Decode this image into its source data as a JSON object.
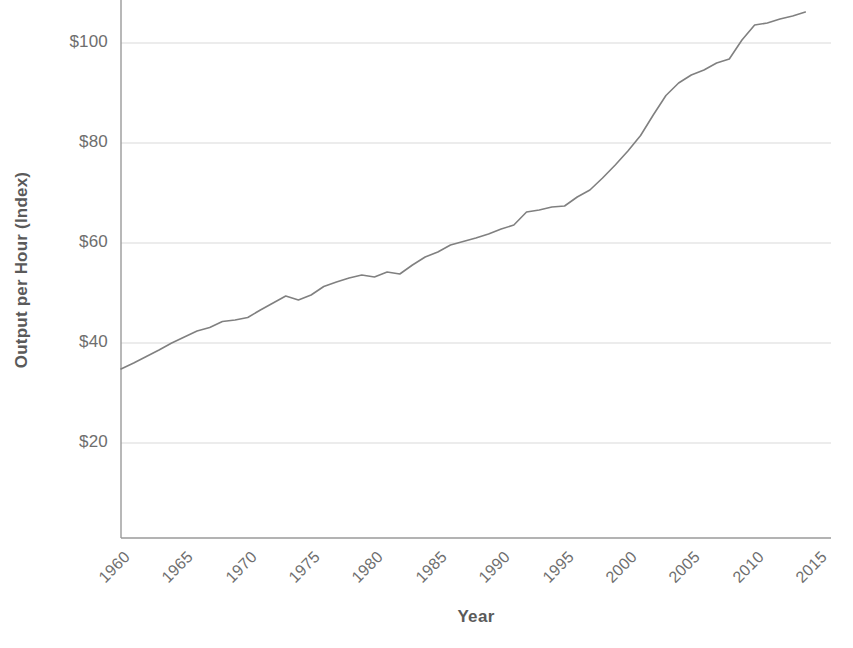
{
  "chart_data": {
    "type": "line",
    "title": "",
    "xlabel": "Year",
    "ylabel": "Output per Hour (Index)",
    "xlim": [
      1960,
      2015
    ],
    "ylim": [
      0,
      110
    ],
    "grid": true,
    "legend": "none",
    "line_color": "#808080",
    "grid_color": "#d9d9d9",
    "axis_color": "#9a9a9a",
    "y_ticks": [
      20,
      40,
      60,
      80,
      100
    ],
    "y_tick_labels": [
      "$20",
      "$40",
      "$60",
      "$80",
      "$100"
    ],
    "x_ticks": [
      1960,
      1965,
      1970,
      1975,
      1980,
      1985,
      1990,
      1995,
      2000,
      2005,
      2010,
      2015
    ],
    "x_tick_labels": [
      "1960",
      "1965",
      "1970",
      "1975",
      "1980",
      "1985",
      "1990",
      "1995",
      "2000",
      "2005",
      "2010",
      "2015"
    ],
    "series": [
      {
        "name": "Output per Hour (Index)",
        "x": [
          1960,
          1961,
          1962,
          1963,
          1964,
          1965,
          1966,
          1967,
          1968,
          1969,
          1970,
          1971,
          1972,
          1973,
          1974,
          1975,
          1976,
          1977,
          1978,
          1979,
          1980,
          1981,
          1982,
          1983,
          1984,
          1985,
          1986,
          1987,
          1988,
          1989,
          1990,
          1991,
          1992,
          1993,
          1994,
          1995,
          1996,
          1997,
          1998,
          1999,
          2000,
          2001,
          2002,
          2003,
          2004,
          2005,
          2006,
          2007,
          2008,
          2009,
          2010,
          2011,
          2012,
          2013,
          2014
        ],
        "values": [
          34.8,
          36.0,
          37.3,
          38.6,
          40.0,
          41.2,
          42.4,
          43.1,
          44.3,
          44.6,
          45.1,
          46.6,
          48.0,
          49.4,
          48.6,
          49.6,
          51.3,
          52.2,
          53.0,
          53.6,
          53.2,
          54.2,
          53.8,
          55.6,
          57.2,
          58.2,
          59.6,
          60.3,
          61.0,
          61.8,
          62.8,
          63.6,
          66.2,
          66.6,
          67.2,
          67.4,
          69.2,
          70.6,
          73.0,
          75.6,
          78.4,
          81.5,
          85.6,
          89.5,
          92.0,
          93.6,
          94.6,
          96.0,
          96.8,
          100.6,
          103.6,
          104.0,
          104.8,
          105.4,
          106.2
        ]
      }
    ]
  }
}
